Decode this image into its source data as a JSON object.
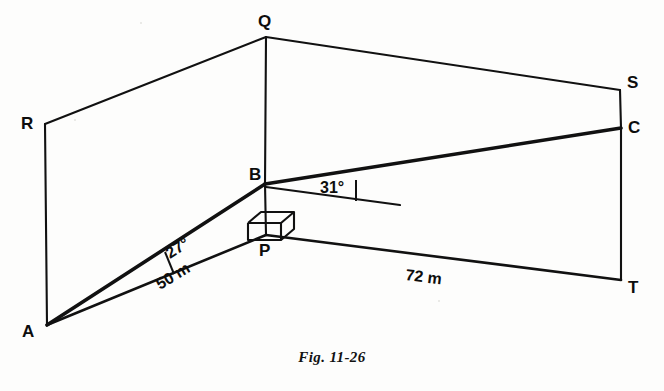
{
  "figure": {
    "caption": "Fig. 11-26",
    "type": "geometry-line-diagram",
    "ink_color": "#111111",
    "background_color": "#fdfdfc"
  },
  "vertices": {
    "A": {
      "label": "A",
      "x": 47,
      "y": 325,
      "label_x": 22,
      "label_y": 337
    },
    "B": {
      "label": "B",
      "x": 265,
      "y": 184,
      "label_x": 249,
      "label_y": 180
    },
    "C": {
      "label": "C",
      "x": 621,
      "y": 128,
      "label_x": 628,
      "label_y": 133
    },
    "P": {
      "label": "P",
      "x": 266,
      "y": 235,
      "label_x": 259,
      "label_y": 256
    },
    "Q": {
      "label": "Q",
      "x": 266,
      "y": 37,
      "label_x": 258,
      "label_y": 27
    },
    "R": {
      "label": "R",
      "x": 45,
      "y": 124,
      "label_x": 21,
      "label_y": 129
    },
    "S": {
      "label": "S",
      "x": 620,
      "y": 90,
      "label_x": 627,
      "label_y": 88
    },
    "T": {
      "label": "T",
      "x": 621,
      "y": 280,
      "label_x": 628,
      "label_y": 293
    }
  },
  "edges": [
    {
      "name": "edge-R-Q",
      "from": "R",
      "to": "Q",
      "weight": "thin"
    },
    {
      "name": "edge-Q-S",
      "from": "Q",
      "to": "S",
      "weight": "thin"
    },
    {
      "name": "edge-R-A",
      "from": "R",
      "to": "A",
      "weight": "thin"
    },
    {
      "name": "edge-Q-B",
      "from": "Q",
      "to": "B",
      "weight": "thin"
    },
    {
      "name": "edge-B-P",
      "from": "B",
      "to": "P",
      "weight": "thin"
    },
    {
      "name": "edge-S-C",
      "from": "S",
      "to": "C",
      "weight": "thin"
    },
    {
      "name": "edge-C-T",
      "from": "C",
      "to": "T",
      "weight": "thin"
    },
    {
      "name": "edge-A-P",
      "from": "A",
      "to": "P",
      "weight": "med"
    },
    {
      "name": "edge-P-T",
      "from": "P",
      "to": "T",
      "weight": "med"
    },
    {
      "name": "line-of-sight-A-B",
      "from": "A",
      "to": "B",
      "weight": "bold"
    },
    {
      "name": "line-of-sight-B-C",
      "from": "B",
      "to": "C",
      "weight": "bold"
    }
  ],
  "reference_line": {
    "name": "horizontal-reference-at-B",
    "x1": 266,
    "y1": 187,
    "x2": 400,
    "y2": 205
  },
  "angles": [
    {
      "name": "angle-27-at-A",
      "value": "27°",
      "vertex": "A",
      "between": [
        "A-B",
        "A-P"
      ],
      "label_x": 170,
      "label_y": 259,
      "rotation": -32,
      "tick": {
        "x1": 165,
        "y1": 252,
        "x2": 174,
        "y2": 274
      }
    },
    {
      "name": "angle-31-at-B",
      "value": "31°",
      "vertex": "B",
      "between": [
        "B-C",
        "horizontal-reference"
      ],
      "label_x": 320,
      "label_y": 193,
      "rotation": 0,
      "tick": {
        "x1": 356,
        "y1": 180,
        "x2": 356,
        "y2": 201
      }
    }
  ],
  "measurements": [
    {
      "name": "measure-A-P",
      "value": "50 m",
      "along": "A-P",
      "label_x": 160,
      "label_y": 290,
      "rotation": -31
    },
    {
      "name": "measure-P-T",
      "value": "72 m",
      "along": "P-T",
      "label_x": 405,
      "label_y": 280,
      "rotation": 7
    }
  ],
  "right_angle_marker": {
    "name": "right-angle-cube-at-P",
    "at": "P",
    "style": "isometric-cube",
    "front": [
      [
        248,
        223
      ],
      [
        248,
        240
      ],
      [
        281,
        240
      ],
      [
        281,
        223
      ]
    ],
    "top": [
      [
        248,
        223
      ],
      [
        261,
        212
      ],
      [
        294,
        212
      ],
      [
        281,
        223
      ]
    ],
    "side": [
      [
        281,
        223
      ],
      [
        294,
        212
      ],
      [
        294,
        229
      ],
      [
        281,
        240
      ]
    ]
  }
}
